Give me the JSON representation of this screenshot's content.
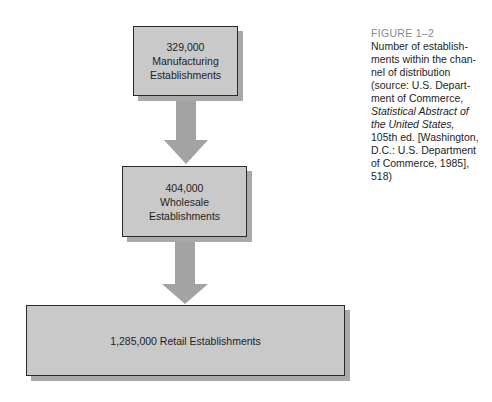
{
  "diagram": {
    "type": "flowchart",
    "nodes": [
      {
        "id": "manufacturing",
        "count": "329,000",
        "line1": "Manufacturing",
        "line2": "Establishments"
      },
      {
        "id": "wholesale",
        "count": "404,000",
        "line1": "Wholesale",
        "line2": "Establishments"
      },
      {
        "id": "retail",
        "label": "1,285,000 Retail Establishments"
      }
    ],
    "edges": [
      {
        "from": "manufacturing",
        "to": "wholesale"
      },
      {
        "from": "wholesale",
        "to": "retail"
      }
    ],
    "colors": {
      "box_fill": "#c9c9c9",
      "box_border": "#2a2a2a",
      "shadow": "#a9a9a9",
      "arrow": "#a3a3a3"
    }
  },
  "caption": {
    "figure_label": "FIGURE 1–2",
    "text_before_italic": "Number of establish-ments within the chan-nel of distribution (source: U.S. Depart-ment of Commerce,",
    "lines": [
      "Number of establish-",
      "ments within the chan-",
      "nel of distribution",
      "(source: U.S. Depart-",
      "ment of Commerce,"
    ],
    "italic_lines": [
      "Statistical Abstract of",
      "the United States,"
    ],
    "after_lines": [
      "105th ed. [Washington,",
      "D.C.: U.S. Department",
      "of Commerce, 1985],",
      "518)"
    ]
  }
}
